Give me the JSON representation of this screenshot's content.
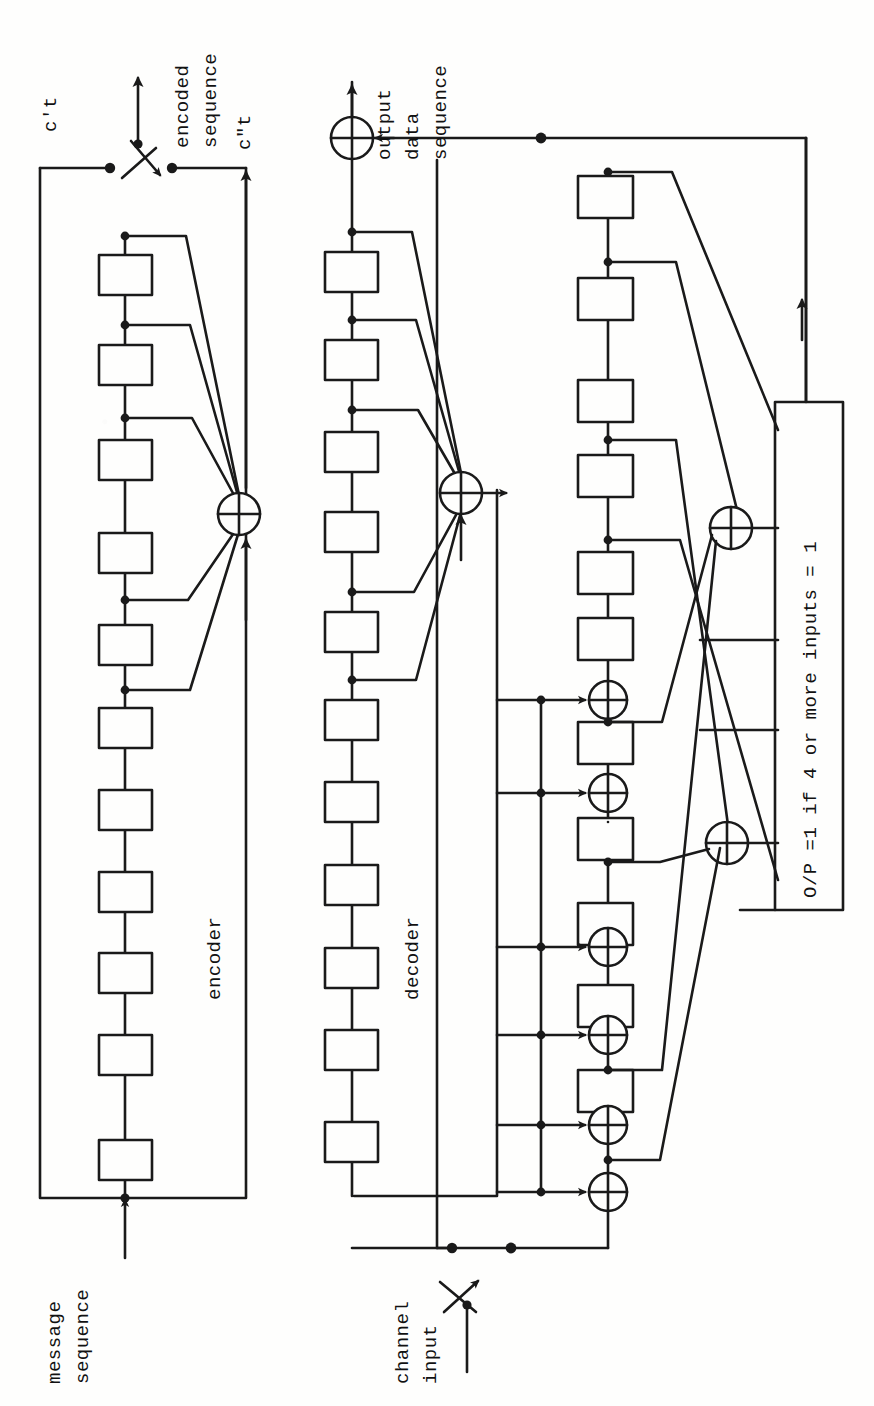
{
  "figure": {
    "orientation": "rotated-90-ccw",
    "ink_color": "#1a1a1a",
    "paper_color": "#fefefd"
  },
  "labels": {
    "message_sequence": "message\nsequence",
    "message_sequence_l1": "message",
    "message_sequence_l2": "sequence",
    "encoder": "encoder",
    "decoder": "decoder",
    "c_prime_t": "c't",
    "c_double_prime_t": "c\"t",
    "encoded_sequence_l1": "encoded",
    "encoded_sequence_l2": "sequence",
    "output_data_sequence_l1": "output",
    "output_data_sequence_l2": "data",
    "output_data_sequence_l3": "sequence",
    "channel_input_l1": "channel",
    "channel_input_l2": "input",
    "majority_gate": "O/P =1 if 4 or more inputs = 1"
  },
  "encoder": {
    "name": "encoder",
    "shift_register_stages": 11,
    "tap_count": 5,
    "tap_stages": [
      1,
      2,
      3,
      5,
      7
    ],
    "adder_symbol": "xor",
    "input_label": "message sequence",
    "output_label": "c\"t"
  },
  "decoder": {
    "name": "decoder",
    "buffer_register_stages": 11,
    "buffer_tap_count": 5,
    "buffer_tap_stages": [
      1,
      2,
      3,
      5,
      7
    ],
    "syndrome_register_stages": 8,
    "syndrome_xor_count": 6,
    "feedback_xor_count": 2,
    "input_label": "channel input",
    "output_label": "output data sequence"
  },
  "majority_logic": {
    "text": "O/P =1 if 4 or more inputs = 1",
    "threshold": 4,
    "input_count": 6
  },
  "switches": [
    {
      "name": "encoder-output-commutator",
      "position": "top-left"
    },
    {
      "name": "channel-input-commutator",
      "position": "bottom-center"
    }
  ]
}
